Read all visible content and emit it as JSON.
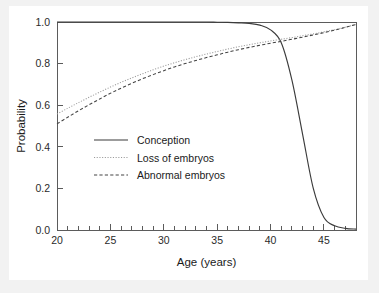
{
  "chart_data": {
    "type": "line",
    "title": "",
    "xlabel": "Age (years)",
    "ylabel": "Probability",
    "xlim": [
      20,
      48
    ],
    "ylim": [
      0.0,
      1.0
    ],
    "grid": false,
    "legend_position": "center-left",
    "x_ticks_major": [
      20,
      25,
      30,
      35,
      40,
      45
    ],
    "x_ticks_major_labels": [
      "20",
      "25",
      "30",
      "35",
      "40",
      "45"
    ],
    "x_ticks_minor_step": 1,
    "y_ticks": [
      0.0,
      0.2,
      0.4,
      0.6,
      0.8,
      1.0
    ],
    "y_ticks_labels": [
      "0.0",
      "0.2",
      "0.4",
      "0.6",
      "0.8",
      "1.0"
    ],
    "x": [
      20,
      21,
      22,
      23,
      24,
      25,
      26,
      27,
      28,
      29,
      30,
      31,
      32,
      33,
      34,
      35,
      36,
      37,
      38,
      39,
      40,
      41,
      42,
      43,
      44,
      45,
      46,
      47,
      48
    ],
    "series": [
      {
        "name": "Conception",
        "style": "solid",
        "color": "#3b3b3b",
        "values": [
          1.0,
          1.0,
          1.0,
          1.0,
          1.0,
          1.0,
          1.0,
          1.0,
          1.0,
          1.0,
          1.0,
          1.0,
          1.0,
          1.0,
          1.0,
          0.999,
          0.998,
          0.996,
          0.993,
          0.985,
          0.962,
          0.9,
          0.72,
          0.46,
          0.2,
          0.06,
          0.02,
          0.008,
          0.004
        ]
      },
      {
        "name": "Loss of embryos",
        "style": "dotted",
        "color": "#9a9a9a",
        "values": [
          0.558,
          0.585,
          0.612,
          0.638,
          0.663,
          0.687,
          0.71,
          0.731,
          0.751,
          0.77,
          0.788,
          0.804,
          0.819,
          0.833,
          0.846,
          0.858,
          0.87,
          0.881,
          0.891,
          0.9,
          0.909,
          0.917,
          0.925,
          0.934,
          0.943,
          0.953,
          0.963,
          0.975,
          0.988
        ]
      },
      {
        "name": "Abnormal embryos",
        "style": "dashed",
        "color": "#444444",
        "values": [
          0.51,
          0.542,
          0.573,
          0.602,
          0.63,
          0.657,
          0.682,
          0.705,
          0.727,
          0.747,
          0.766,
          0.784,
          0.8,
          0.815,
          0.829,
          0.842,
          0.855,
          0.867,
          0.878,
          0.888,
          0.898,
          0.907,
          0.917,
          0.927,
          0.938,
          0.949,
          0.961,
          0.974,
          0.988
        ]
      }
    ]
  },
  "legend": {
    "items": [
      {
        "label": "Conception"
      },
      {
        "label": "Loss of embryos"
      },
      {
        "label": "Abnormal embryos"
      }
    ]
  },
  "axes": {
    "x_title": "Age (years)",
    "y_title": "Probability"
  }
}
